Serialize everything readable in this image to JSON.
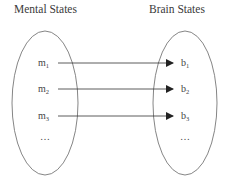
{
  "titles": {
    "left": "Mental States",
    "right": "Brain States"
  },
  "left_set": {
    "items": [
      {
        "base": "m",
        "sub": "1"
      },
      {
        "base": "m",
        "sub": "2"
      },
      {
        "base": "m",
        "sub": "3"
      }
    ],
    "ellipsis": "…"
  },
  "right_set": {
    "items": [
      {
        "base": "b",
        "sub": "1"
      },
      {
        "base": "b",
        "sub": "2"
      },
      {
        "base": "b",
        "sub": "3"
      }
    ],
    "ellipsis": "…"
  },
  "mappings": [
    {
      "from": "m1",
      "to": "b1"
    },
    {
      "from": "m2",
      "to": "b2"
    },
    {
      "from": "m3",
      "to": "b3"
    }
  ],
  "colors": {
    "stroke": "#555555",
    "arrow": "#222222"
  }
}
